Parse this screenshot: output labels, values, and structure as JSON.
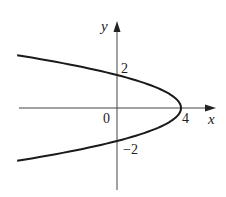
{
  "chart_data": {
    "type": "line",
    "title": "",
    "equation_implied": "x = 4 - y^2",
    "xlabel": "x",
    "ylabel": "y",
    "tick_labels": {
      "origin": "0",
      "x": [
        "4"
      ],
      "y": [
        "2",
        "-2"
      ]
    },
    "grid": false,
    "legend": null,
    "series": [
      {
        "name": "parabola",
        "points": [
          {
            "x": -6.25,
            "y": 3.2
          },
          {
            "x": -5,
            "y": 3
          },
          {
            "x": -2.25,
            "y": 2.5
          },
          {
            "x": 0,
            "y": 2
          },
          {
            "x": 1.75,
            "y": 1.5
          },
          {
            "x": 3,
            "y": 1
          },
          {
            "x": 3.75,
            "y": 0.5
          },
          {
            "x": 4,
            "y": 0
          },
          {
            "x": 3.75,
            "y": -0.5
          },
          {
            "x": 3,
            "y": -1
          },
          {
            "x": 1.75,
            "y": -1.5
          },
          {
            "x": 0,
            "y": -2
          },
          {
            "x": -2.25,
            "y": -2.5
          },
          {
            "x": -5,
            "y": -3
          },
          {
            "x": -6.25,
            "y": -3.2
          }
        ]
      }
    ],
    "xlim": [
      -6.3,
      6.2
    ],
    "ylim": [
      -5.5,
      5.2
    ]
  },
  "labels": {
    "x_axis": "x",
    "y_axis": "y",
    "origin": "0",
    "x_tick_4": "4",
    "y_tick_2": "2",
    "y_tick_neg2": "−2"
  }
}
